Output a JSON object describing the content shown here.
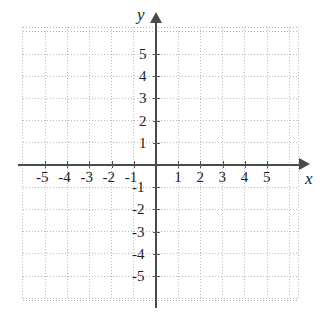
{
  "figure": {
    "kind": "cartesian-coordinate-plane",
    "background_color": "#ffffff",
    "axis_color": "#4a4a4a",
    "grid_color": "#b9b9b9",
    "label_color": "#1c1c1c"
  },
  "axes": {
    "x_label": "x",
    "y_label": "y",
    "x_arrow": "arrow-right",
    "y_arrow": "arrow-up"
  },
  "chart_data": {
    "type": "scatter",
    "title": "",
    "subtitle": "",
    "xlabel": "x",
    "ylabel": "y",
    "xlim": [
      -6.0,
      6.4
    ],
    "ylim": [
      -6.1,
      6.2
    ],
    "xticks": [
      -5,
      -4,
      -3,
      -2,
      -1,
      1,
      2,
      3,
      4,
      5
    ],
    "yticks": [
      5,
      4,
      3,
      2,
      1,
      -1,
      -2,
      -3,
      -4,
      -5
    ],
    "xtick_labels": [
      "-5",
      "-4",
      "-3",
      "-2",
      "-1",
      "1",
      "2",
      "3",
      "4",
      "5"
    ],
    "ytick_labels": [
      "5",
      "4",
      "3",
      "2",
      "1",
      "-1",
      "-2",
      "-3",
      "-4",
      "-5"
    ],
    "grid": true,
    "grid_style": "dotted",
    "unit_spacing_px": 22.2,
    "origin_px": [
      156,
      165
    ],
    "legend": [],
    "series": [],
    "values": [],
    "annotations": []
  },
  "tick_labels": {
    "x_negative": [
      {
        "text": "-5",
        "value": -5
      },
      {
        "text": "-4",
        "value": -4
      },
      {
        "text": "-3",
        "value": -3
      },
      {
        "text": "-2",
        "value": -2
      },
      {
        "text": "-1",
        "value": -1
      }
    ],
    "x_positive": [
      {
        "text": "1",
        "value": 1
      },
      {
        "text": "2",
        "value": 2
      },
      {
        "text": "3",
        "value": 3
      },
      {
        "text": "4",
        "value": 4
      },
      {
        "text": "5",
        "value": 5
      }
    ],
    "y_positive": [
      {
        "text": "5",
        "value": 5
      },
      {
        "text": "4",
        "value": 4
      },
      {
        "text": "3",
        "value": 3
      },
      {
        "text": "2",
        "value": 2
      },
      {
        "text": "1",
        "value": 1
      }
    ],
    "y_negative": [
      {
        "text": "-1",
        "value": -1
      },
      {
        "text": "-2",
        "value": -2
      },
      {
        "text": "-3",
        "value": -3
      },
      {
        "text": "-4",
        "value": -4
      },
      {
        "text": "-5",
        "value": -5
      }
    ]
  }
}
